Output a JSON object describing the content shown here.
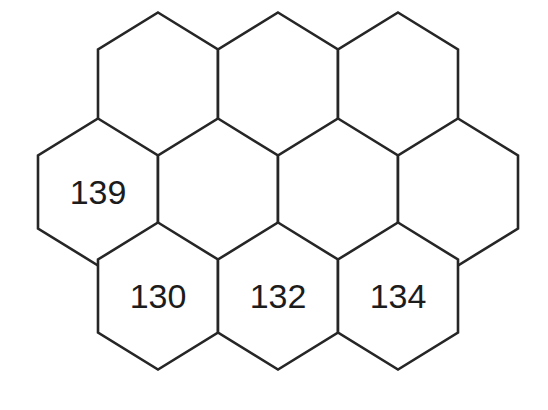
{
  "figure": {
    "name": "hexagonal-cell-grid",
    "background_color": "#ffffff",
    "stroke_color": "#262626",
    "stroke_width": 2.6,
    "label_color": "#1c1c1c",
    "label_font_size": 34
  },
  "geometry": {
    "hex_width": 120,
    "hex_side_vertical": 73,
    "hex_point_height": 37,
    "row_pitch": 110,
    "orientation": "pointy-top"
  },
  "chart_data": {
    "type": "diagram",
    "title": "",
    "rows": [
      {
        "row_index": 0,
        "center_y": 86,
        "cells": [
          {
            "id": "r0c0",
            "cx": 158,
            "cy": 86,
            "label": ""
          },
          {
            "id": "r0c1",
            "cx": 278,
            "cy": 86,
            "label": ""
          },
          {
            "id": "r0c2",
            "cx": 398,
            "cy": 86,
            "label": ""
          }
        ]
      },
      {
        "row_index": 1,
        "center_y": 192,
        "cells": [
          {
            "id": "r1c0",
            "cx": 98,
            "cy": 192,
            "label": "139"
          },
          {
            "id": "r1c1",
            "cx": 218,
            "cy": 192,
            "label": ""
          },
          {
            "id": "r1c2",
            "cx": 338,
            "cy": 192,
            "label": ""
          },
          {
            "id": "r1c3",
            "cx": 458,
            "cy": 192,
            "label": ""
          }
        ]
      },
      {
        "row_index": 2,
        "center_y": 296,
        "cells": [
          {
            "id": "r2c0",
            "cx": 158,
            "cy": 296,
            "label": "130"
          },
          {
            "id": "r2c1",
            "cx": 278,
            "cy": 296,
            "label": "132"
          },
          {
            "id": "r2c2",
            "cx": 398,
            "cy": 296,
            "label": "134"
          }
        ]
      }
    ],
    "labels": [
      "139",
      "130",
      "132",
      "134"
    ],
    "total_cells": 10,
    "labeled_cells": 4
  }
}
